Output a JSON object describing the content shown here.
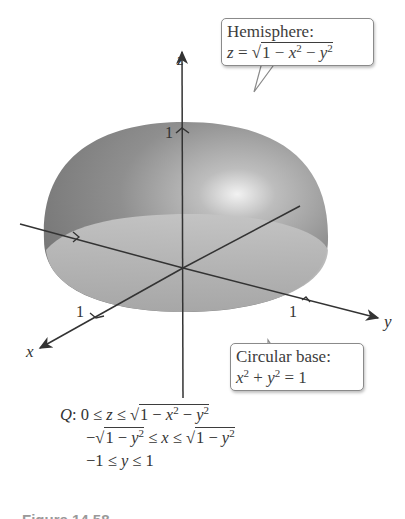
{
  "figure": {
    "axes": {
      "x_label": "x",
      "y_label": "y",
      "z_label": "z"
    },
    "ticks": {
      "z_tick": "1",
      "x_tick": "1",
      "y_tick": "1"
    },
    "surface_color": "#8c8c8c",
    "base_color": "#b3b3b3",
    "hemisphere_callout": {
      "title": "Hemisphere:",
      "lhs": "z",
      "eq": " = ",
      "radicand_a": "1 − ",
      "var1": "x",
      "exp1": "2",
      "minus": " − ",
      "var2": "y",
      "exp2": "2"
    },
    "base_callout": {
      "title": "Circular base:",
      "var1": "x",
      "exp1": "2",
      "plus": " + ",
      "var2": "y",
      "exp2": "2",
      "rhs": " = 1"
    }
  },
  "region": {
    "label": "Q",
    "line1": {
      "lead": ": 0 ≤ ",
      "var": "z",
      "mid": " ≤ ",
      "radicand_a": "1 − ",
      "v1": "x",
      "e1": "2",
      "minus": " − ",
      "v2": "y",
      "e2": "2"
    },
    "line2": {
      "neg": "−",
      "radicand_a": "1 − ",
      "v1": "y",
      "e1": "2",
      "mid": " ≤ ",
      "var": "x",
      "mid2": " ≤ ",
      "radicand_b": "1 − ",
      "v2": "y",
      "e2": "2"
    },
    "line3": {
      "lead": "−1 ≤ ",
      "var": "y",
      "tail": " ≤ 1"
    }
  },
  "caption": "Figure 14.58"
}
